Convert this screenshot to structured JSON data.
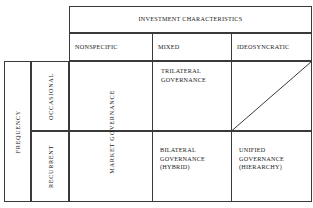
{
  "figure": {
    "header": {
      "title": "INVESTMENT CHARACTERISTICS",
      "columns": [
        {
          "key": "nonspecific",
          "label": "NONSPECIFIC"
        },
        {
          "key": "mixed",
          "label": "MIXED"
        },
        {
          "key": "ideosyncratic",
          "label": "IDEOSYNCRATIC"
        }
      ]
    },
    "row_axis": {
      "title": "FREQUENCY",
      "rows": [
        {
          "key": "occasional",
          "label": "OCCASIONAL"
        },
        {
          "key": "recurrent",
          "label": "RECURRENT"
        }
      ]
    },
    "cells": {
      "market_governance": "MARKET GOVERNANCE",
      "trilateral_governance": "TRILATERAL GOVERNANCE",
      "bilateral_governance": "BILATERAL\nGOVERNANCE\n(HYBRID)",
      "unified_governance": "UNIFIED\nGOVERNANCE\n(HIERARCHY)"
    },
    "style": {
      "line_color": "#3a3a3a",
      "text_color": "#1a1a1a",
      "background": "#ffffff"
    }
  }
}
